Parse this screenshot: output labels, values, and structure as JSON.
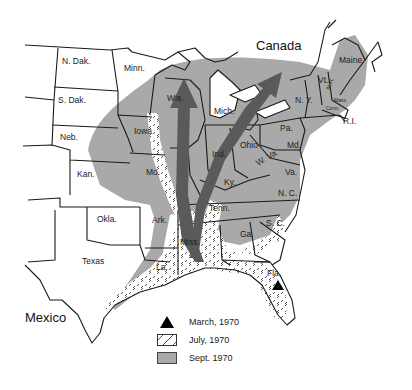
{
  "map": {
    "title_regions": {
      "canada": "Canada",
      "mexico": "Mexico"
    },
    "states": [
      {
        "label": "N. Dak.",
        "x": 62,
        "y": 64
      },
      {
        "label": "Minn.",
        "x": 124,
        "y": 71
      },
      {
        "label": "S. Dak.",
        "x": 58,
        "y": 103
      },
      {
        "label": "Neb.",
        "x": 60,
        "y": 140
      },
      {
        "label": "Iowa",
        "x": 134,
        "y": 134
      },
      {
        "label": "Kan.",
        "x": 77,
        "y": 177
      },
      {
        "label": "Mo.",
        "x": 146,
        "y": 175
      },
      {
        "label": "Okla.",
        "x": 97,
        "y": 222
      },
      {
        "label": "Ark.",
        "x": 152,
        "y": 223
      },
      {
        "label": "Texas",
        "x": 82,
        "y": 264
      },
      {
        "label": "La.",
        "x": 156,
        "y": 270
      },
      {
        "label": "Miss.",
        "x": 180,
        "y": 245
      },
      {
        "label": "Wis.",
        "x": 167,
        "y": 101
      },
      {
        "label": "Mich.",
        "x": 214,
        "y": 114
      },
      {
        "label": "Ind.",
        "x": 212,
        "y": 157
      },
      {
        "label": "Ohio",
        "x": 240,
        "y": 148
      },
      {
        "label": "Ky.",
        "x": 224,
        "y": 185
      },
      {
        "label": "Tenn.",
        "x": 209,
        "y": 211
      },
      {
        "label": "W. Va.",
        "x": 258,
        "y": 166
      },
      {
        "label": "Va.",
        "x": 285,
        "y": 175
      },
      {
        "label": "Md.",
        "x": 287,
        "y": 148
      },
      {
        "label": "Pa.",
        "x": 280,
        "y": 131
      },
      {
        "label": "N. Y.",
        "x": 301,
        "y": 103
      },
      {
        "label": "Vt.",
        "x": 318,
        "y": 83
      },
      {
        "label": "N.H.",
        "x": 330,
        "y": 90
      },
      {
        "label": "Maine",
        "x": 352,
        "y": 63
      },
      {
        "label": "Mass.",
        "x": 340,
        "y": 98
      },
      {
        "label": "Conn.",
        "x": 329,
        "y": 108
      },
      {
        "label": "R.I.",
        "x": 343,
        "y": 122
      },
      {
        "label": "N. C.",
        "x": 282,
        "y": 196
      },
      {
        "label": "S. C.",
        "x": 272,
        "y": 224
      },
      {
        "label": "Ga.",
        "x": 244,
        "y": 237
      },
      {
        "label": "Fla.",
        "x": 275,
        "y": 276
      }
    ],
    "markers": [
      {
        "type": "triangle",
        "meaning": "March, 1970",
        "location": "Fla."
      }
    ],
    "arrows": [
      {
        "from": "Miss.",
        "to": "Wis.",
        "direction": "north"
      },
      {
        "from": "Miss.",
        "to": "N. Y.",
        "direction": "northeast"
      }
    ]
  },
  "legend": {
    "items": [
      {
        "symbol": "triangle",
        "label": "March, 1970"
      },
      {
        "symbol": "hatched",
        "label": "July, 1970"
      },
      {
        "symbol": "gray",
        "label": "Sept. 1970"
      }
    ]
  },
  "colors": {
    "sept_fill": "#a9a9a9",
    "arrow": "#5a5a5a",
    "border": "#1a1a1a",
    "marker": "#000000"
  }
}
